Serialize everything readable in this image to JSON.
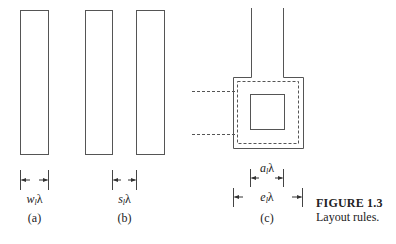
{
  "figure": {
    "title": "FIGURE 1.3",
    "caption": "Layout rules."
  },
  "panels": {
    "a": {
      "tag": "(a)",
      "dim_var": "w",
      "dim_sub": "l",
      "dim_unit": "λ"
    },
    "b": {
      "tag": "(b)",
      "dim_var": "s",
      "dim_sub": "l",
      "dim_unit": "λ"
    },
    "c": {
      "tag": "(c)",
      "inner_dim": {
        "var": "a",
        "sub": "l",
        "unit": "λ"
      },
      "outer_dim": {
        "var": "e",
        "sub": "l",
        "unit": "λ"
      }
    }
  },
  "colors": {
    "stroke": "#555555",
    "text": "#222222",
    "background": "#ffffff"
  }
}
